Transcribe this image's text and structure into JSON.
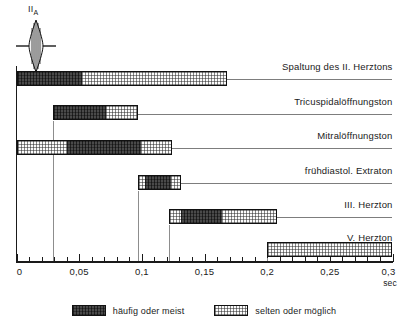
{
  "ecg": {
    "label": "II",
    "sublabel": "A",
    "icon": "heart-sound-spindle-icon"
  },
  "axis": {
    "label": "",
    "unit": "sec",
    "min": 0,
    "max": 0.3,
    "major_step": 0.05,
    "minor_step": 0.01,
    "tick_labels": [
      "0",
      "0,05",
      "0,1",
      "0,15",
      "0,2",
      "0,25",
      "0,3"
    ],
    "tick_values": [
      0,
      0.05,
      0.1,
      0.15,
      0.2,
      0.25,
      0.3
    ]
  },
  "legend": {
    "items": [
      {
        "label": "häufig oder meist",
        "fill": "heavy",
        "color": "#4a4a4a"
      },
      {
        "label": "selten oder möglich",
        "fill": "light",
        "color": "#fbfbfb"
      }
    ]
  },
  "chart_data": {
    "type": "bar",
    "title": "",
    "subtitle": "",
    "xlabel": "sec",
    "ylabel": "",
    "xlim": [
      0,
      0.3
    ],
    "grid": false,
    "orientation": "horizontal",
    "note": "Timing (range) of extra heart sounds after the second heart sound (II A). Dark = frequent/mostly, light = rare/possible.",
    "legend_position": "bottom-center",
    "categories": [
      "Spaltung des II. Herztons",
      "Tricuspidalöffnungston",
      "Mitralöffnungston",
      "frühdiastol. Extraton",
      "III. Herzton",
      "V. Herzton"
    ],
    "bars": [
      {
        "label": "Spaltung des II. Herztons",
        "start": 0.0,
        "end": 0.168,
        "segments": [
          {
            "fill": "heavy",
            "start": 0.0,
            "end": 0.052
          },
          {
            "fill": "light",
            "start": 0.052,
            "end": 0.168
          }
        ]
      },
      {
        "label": "Tricuspidalöffnungston",
        "start": 0.029,
        "end": 0.097,
        "segments": [
          {
            "fill": "heavy",
            "start": 0.029,
            "end": 0.072
          },
          {
            "fill": "light",
            "start": 0.072,
            "end": 0.097
          }
        ]
      },
      {
        "label": "Mitralöffnungston",
        "start": 0.0,
        "end": 0.124,
        "segments": [
          {
            "fill": "light",
            "start": 0.0,
            "end": 0.04
          },
          {
            "fill": "heavy",
            "start": 0.04,
            "end": 0.1
          },
          {
            "fill": "light",
            "start": 0.1,
            "end": 0.124
          }
        ]
      },
      {
        "label": "frühdiastol. Extraton",
        "start": 0.097,
        "end": 0.131,
        "segments": [
          {
            "fill": "light",
            "start": 0.097,
            "end": 0.102
          },
          {
            "fill": "heavy",
            "start": 0.102,
            "end": 0.124
          },
          {
            "fill": "light",
            "start": 0.124,
            "end": 0.131
          }
        ]
      },
      {
        "label": "III. Herzton",
        "start": 0.122,
        "end": 0.208,
        "segments": [
          {
            "fill": "light",
            "start": 0.122,
            "end": 0.131
          },
          {
            "fill": "heavy",
            "start": 0.131,
            "end": 0.164
          },
          {
            "fill": "light",
            "start": 0.164,
            "end": 0.208
          }
        ]
      },
      {
        "label": "V. Herzton",
        "start": 0.2,
        "end": 0.3,
        "segments": [
          {
            "fill": "light",
            "start": 0.2,
            "end": 0.3
          }
        ]
      }
    ]
  }
}
